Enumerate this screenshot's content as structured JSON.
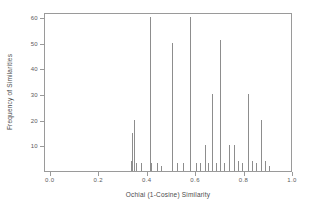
{
  "chart_data": {
    "type": "bar",
    "title": "",
    "xlabel": "Ochiai (1-Cosine) Similarity",
    "ylabel": "Frequency of Similarities",
    "xlim": [
      -0.024,
      1.0
    ],
    "ylim": [
      0,
      62
    ],
    "grid": false,
    "legend": null,
    "xticks": [
      "0.0",
      "0.2",
      "0.4",
      "0.6",
      "0.8",
      "1.0"
    ],
    "xtick_values": [
      0.0,
      0.2,
      0.4,
      0.6,
      0.8,
      1.0
    ],
    "yticks": [
      "10",
      "20",
      "30",
      "40",
      "50",
      "60"
    ],
    "ytick_values": [
      10,
      20,
      30,
      40,
      50,
      60
    ],
    "x": [
      0.33,
      0.335,
      0.345,
      0.352,
      0.372,
      0.408,
      0.415,
      0.44,
      0.455,
      0.5,
      0.52,
      0.545,
      0.575,
      0.6,
      0.618,
      0.635,
      0.648,
      0.665,
      0.682,
      0.7,
      0.715,
      0.735,
      0.755,
      0.772,
      0.79,
      0.815,
      0.832,
      0.848,
      0.868,
      0.885,
      0.9
    ],
    "values": [
      4,
      15,
      20,
      3,
      3,
      60,
      3,
      3,
      2,
      50,
      3,
      3,
      60,
      3,
      3,
      10,
      3,
      30,
      3,
      51,
      3,
      10,
      10,
      4,
      3,
      30,
      4,
      3,
      20,
      4,
      2
    ],
    "series": [
      {
        "name": "Frequency of Similarities",
        "values": [
          4,
          15,
          20,
          3,
          3,
          60,
          3,
          3,
          2,
          50,
          3,
          3,
          60,
          3,
          3,
          10,
          3,
          30,
          3,
          51,
          3,
          10,
          10,
          4,
          3,
          30,
          4,
          3,
          20,
          4,
          2
        ]
      }
    ]
  }
}
